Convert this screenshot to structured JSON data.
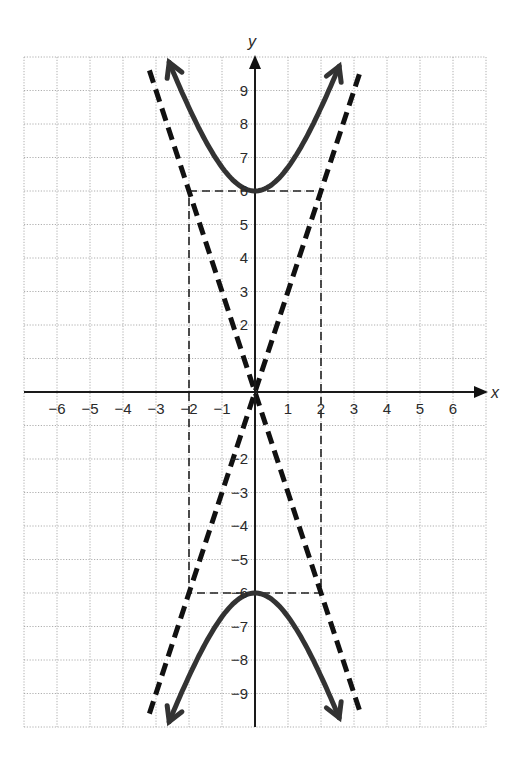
{
  "chart_data": {
    "type": "line",
    "title": "",
    "xlabel": "x",
    "ylabel": "y",
    "xlim": [
      -7,
      7
    ],
    "ylim": [
      -10,
      10
    ],
    "grid": true,
    "x_ticks": [
      -6,
      -5,
      -4,
      -3,
      -2,
      -1,
      1,
      2,
      3,
      4,
      5,
      6
    ],
    "x_tick_labels": [
      "−6",
      "−5",
      "−4",
      "−3",
      "−2",
      "−1",
      "1",
      "2",
      "3",
      "4",
      "5",
      "6"
    ],
    "y_ticks": [
      9,
      8,
      7,
      6,
      5,
      4,
      3,
      2,
      -2,
      -3,
      -4,
      -5,
      -6,
      -7,
      -8,
      -9
    ],
    "y_tick_labels": [
      "9",
      "8",
      "7",
      "6",
      "5",
      "4",
      "3",
      "2",
      "−2",
      "−3",
      "−4",
      "−5",
      "−6",
      "−7",
      "−8",
      "−9"
    ],
    "equation": "y²/36 − x²/4 = 1",
    "series": [
      {
        "name": "hyperbola upper branch",
        "style": "solid-thick",
        "color": "#333333",
        "x_range": [
          -2.6,
          2.55
        ],
        "vertex": [
          0,
          6
        ],
        "arrows": "both-ends"
      },
      {
        "name": "hyperbola lower branch",
        "style": "solid-thick",
        "color": "#333333",
        "x_range": [
          -2.6,
          2.55
        ],
        "vertex": [
          0,
          -6
        ],
        "arrows": "both-ends"
      },
      {
        "name": "asymptote y = 3x",
        "style": "dashed-thick",
        "color": "#111111",
        "points": [
          [
            -3.2,
            -9.6
          ],
          [
            3.2,
            9.6
          ]
        ]
      },
      {
        "name": "asymptote y = -3x",
        "style": "dashed-thick",
        "color": "#111111",
        "points": [
          [
            -3.2,
            9.6
          ],
          [
            3.2,
            -9.6
          ]
        ]
      },
      {
        "name": "central rectangle",
        "style": "dashed-thin",
        "color": "#222222",
        "corners": [
          [
            -2,
            6
          ],
          [
            2,
            6
          ],
          [
            2,
            -6
          ],
          [
            -2,
            -6
          ]
        ]
      }
    ],
    "vertices": [
      [
        0,
        6
      ],
      [
        0,
        -6
      ]
    ],
    "legend": null
  },
  "layout": {
    "origin_px": [
      255,
      392
    ],
    "unit_x_px": 33,
    "unit_y_px": 33.5
  }
}
